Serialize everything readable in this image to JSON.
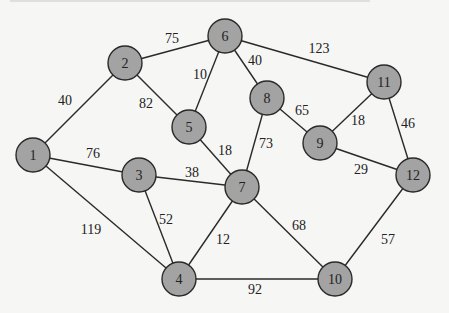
{
  "diagram": {
    "type": "weighted-undirected-graph",
    "colors": {
      "node_fill": "#a3a3a3",
      "stroke": "#2a2a2a",
      "text": "#222222",
      "background": "#f6f6f4"
    },
    "nodes": [
      {
        "id": "1",
        "label": "1",
        "x": 33,
        "y": 155
      },
      {
        "id": "2",
        "label": "2",
        "x": 125,
        "y": 63
      },
      {
        "id": "3",
        "label": "3",
        "x": 139,
        "y": 175
      },
      {
        "id": "4",
        "label": "4",
        "x": 179,
        "y": 279
      },
      {
        "id": "5",
        "label": "5",
        "x": 189,
        "y": 127
      },
      {
        "id": "6",
        "label": "6",
        "x": 225,
        "y": 36
      },
      {
        "id": "7",
        "label": "7",
        "x": 242,
        "y": 187
      },
      {
        "id": "8",
        "label": "8",
        "x": 267,
        "y": 98
      },
      {
        "id": "9",
        "label": "9",
        "x": 320,
        "y": 143
      },
      {
        "id": "10",
        "label": "10",
        "x": 335,
        "y": 279
      },
      {
        "id": "11",
        "label": "11",
        "x": 384,
        "y": 82
      },
      {
        "id": "12",
        "label": "12",
        "x": 413,
        "y": 175
      }
    ],
    "edges": [
      {
        "from": "1",
        "to": "2",
        "weight": "40",
        "lx": 65,
        "ly": 100
      },
      {
        "from": "1",
        "to": "3",
        "weight": "76",
        "lx": 93,
        "ly": 153
      },
      {
        "from": "1",
        "to": "4",
        "weight": "119",
        "lx": 91,
        "ly": 229
      },
      {
        "from": "2",
        "to": "6",
        "weight": "75",
        "lx": 172,
        "ly": 38
      },
      {
        "from": "2",
        "to": "5",
        "weight": "82",
        "lx": 146,
        "ly": 103
      },
      {
        "from": "6",
        "to": "5",
        "weight": "10",
        "lx": 200,
        "ly": 74
      },
      {
        "from": "6",
        "to": "8",
        "weight": "40",
        "lx": 255,
        "ly": 60
      },
      {
        "from": "6",
        "to": "11",
        "weight": "123",
        "lx": 319,
        "ly": 48
      },
      {
        "from": "5",
        "to": "7",
        "weight": "18",
        "lx": 225,
        "ly": 150
      },
      {
        "from": "3",
        "to": "7",
        "weight": "38",
        "lx": 192,
        "ly": 172
      },
      {
        "from": "3",
        "to": "4",
        "weight": "52",
        "lx": 166,
        "ly": 219
      },
      {
        "from": "8",
        "to": "7",
        "weight": "73",
        "lx": 266,
        "ly": 143
      },
      {
        "from": "8",
        "to": "9",
        "weight": "65",
        "lx": 302,
        "ly": 110
      },
      {
        "from": "11",
        "to": "9",
        "weight": "18",
        "lx": 358,
        "ly": 120
      },
      {
        "from": "11",
        "to": "12",
        "weight": "46",
        "lx": 408,
        "ly": 123
      },
      {
        "from": "9",
        "to": "12",
        "weight": "29",
        "lx": 361,
        "ly": 169
      },
      {
        "from": "7",
        "to": "4",
        "weight": "12",
        "lx": 223,
        "ly": 239
      },
      {
        "from": "7",
        "to": "10",
        "weight": "68",
        "lx": 299,
        "ly": 225
      },
      {
        "from": "12",
        "to": "10",
        "weight": "57",
        "lx": 388,
        "ly": 239
      },
      {
        "from": "4",
        "to": "10",
        "weight": "92",
        "lx": 255,
        "ly": 289
      }
    ]
  }
}
